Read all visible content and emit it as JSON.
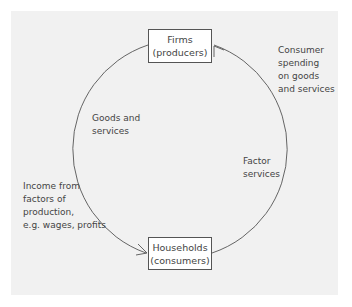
{
  "nodes": {
    "firms": {
      "line1": "Firms",
      "line2": "(producers)"
    },
    "households": {
      "line1": "Households",
      "line2": "(consumers)"
    }
  },
  "flows": {
    "consumer_spending": [
      "Consumer",
      "spending",
      "on goods",
      "and services"
    ],
    "goods_services": [
      "Goods and",
      "services"
    ],
    "factor_services": [
      "Factor",
      "services"
    ],
    "income": [
      "Income from",
      "factors of",
      "production,",
      "e.g. wages, profits"
    ]
  },
  "colors": {
    "background": "#f1f1f1",
    "line": "#555555",
    "box": "#ffffff"
  }
}
